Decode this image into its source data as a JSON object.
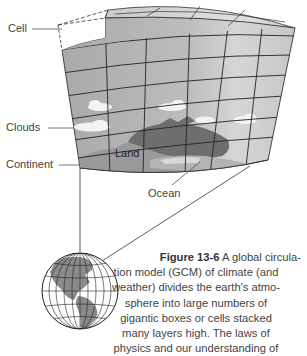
{
  "figure": {
    "labels": {
      "cell": "Cell",
      "clouds": "Clouds",
      "continent": "Continent",
      "land": "Land",
      "ocean": "Ocean"
    },
    "caption": {
      "number": "Figure 13-6",
      "lines": [
        "A global circula-",
        "tion model (GCM) of climate (and",
        "weather) divides the earth's atmo-",
        "sphere into large numbers of",
        "gigantic boxes or cells stacked",
        "many layers high. The laws of",
        "physics and our understanding of"
      ]
    },
    "colors": {
      "grid_face": "#b8b8b8",
      "grid_top": "#cfcfcf",
      "grid_side": "#dcdcdc",
      "land": "#8f8f8f",
      "continent_dark": "#6f6f6f",
      "ocean": "#a5a5a5",
      "clouds": "#f2f2f2",
      "lines": "#222222"
    }
  }
}
